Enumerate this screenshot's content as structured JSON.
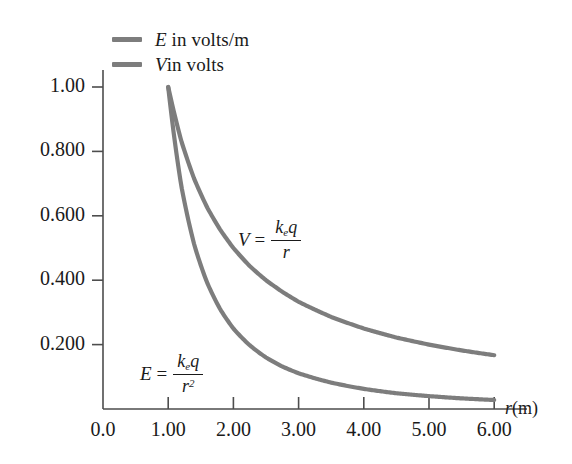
{
  "chart_data": {
    "type": "line",
    "title": "",
    "xlabel": "r (m)",
    "ylabel": "",
    "xlim": [
      0.0,
      6.4
    ],
    "ylim": [
      0.0,
      1.08
    ],
    "grid": false,
    "legend_position": "top-left",
    "x_ticks": [
      "0.0",
      "1.00",
      "2.00",
      "3.00",
      "4.00",
      "5.00",
      "6.00"
    ],
    "x_tick_values": [
      0.0,
      1.0,
      2.0,
      3.0,
      4.0,
      5.0,
      6.0
    ],
    "y_ticks": [
      "0.200",
      "0.400",
      "0.600",
      "0.800",
      "1.00"
    ],
    "y_tick_values": [
      0.2,
      0.4,
      0.6,
      0.8,
      1.0
    ],
    "series": [
      {
        "name": "E in volts/m",
        "formula": "E = k_e q / r^2",
        "color": "#7d7d7d",
        "x": [
          1.0,
          1.2,
          1.4,
          1.6,
          1.8,
          2.0,
          2.25,
          2.5,
          2.75,
          3.0,
          3.5,
          4.0,
          4.5,
          5.0,
          5.5,
          6.0
        ],
        "values": [
          1.0,
          0.694,
          0.51,
          0.391,
          0.309,
          0.25,
          0.198,
          0.16,
          0.132,
          0.111,
          0.082,
          0.0625,
          0.049,
          0.04,
          0.033,
          0.028
        ]
      },
      {
        "name": "V in volts",
        "formula": "V = k_e q / r",
        "color": "#7d7d7d",
        "x": [
          1.0,
          1.2,
          1.4,
          1.6,
          1.8,
          2.0,
          2.25,
          2.5,
          2.75,
          3.0,
          3.5,
          4.0,
          4.5,
          5.0,
          5.5,
          6.0
        ],
        "values": [
          1.0,
          0.833,
          0.714,
          0.625,
          0.556,
          0.5,
          0.444,
          0.4,
          0.364,
          0.333,
          0.286,
          0.25,
          0.222,
          0.2,
          0.182,
          0.167
        ]
      }
    ]
  },
  "legend": {
    "items": [
      {
        "symbol": "E",
        "text": " in volts/m",
        "color": "#7d7d7d"
      },
      {
        "symbol": "V",
        "text": "in volts",
        "color": "#7d7d7d"
      }
    ]
  },
  "annotations": {
    "v_curve": {
      "symbol": "V",
      "equals": "=",
      "numerator": "k",
      "numerator_sub": "e",
      "numerator_q": "q",
      "denominator": "r",
      "denominator_exp": ""
    },
    "e_curve": {
      "symbol": "E",
      "equals": "=",
      "numerator": "k",
      "numerator_sub": "e",
      "numerator_q": "q",
      "denominator": "r",
      "denominator_exp": "2"
    }
  },
  "axes": {
    "x_label_symbol": "r",
    "x_label_unit": "(m)",
    "axis_color": "#4d4d4d"
  }
}
